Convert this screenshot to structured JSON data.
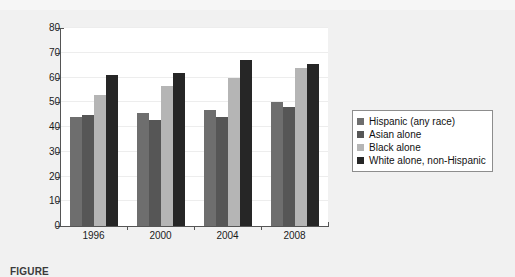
{
  "figure": {
    "background_color": "#f1f1f1",
    "plot_background_color": "#ffffff",
    "caption": "FIGURE"
  },
  "legend": {
    "position": "right",
    "border_color": "#8d8d8d",
    "entries": [
      {
        "label": "Hispanic (any race)",
        "color": "#6e6e6e"
      },
      {
        "label": "Asian alone",
        "color": "#565656"
      },
      {
        "label": "Black alone",
        "color": "#b5b5b5"
      },
      {
        "label": "White alone, non-Hispanic",
        "color": "#262626"
      }
    ]
  },
  "axes": {
    "y_ticks": [
      "0",
      "10",
      "20",
      "30",
      "40",
      "50",
      "60",
      "70",
      "80"
    ],
    "x_ticks": [
      "1996",
      "2000",
      "2004",
      "2008"
    ]
  },
  "chart_data": {
    "type": "bar",
    "title": "",
    "subtitle": "",
    "xlabel": "",
    "ylabel": "",
    "ylim": [
      0,
      80
    ],
    "ytick_step": 10,
    "grid": true,
    "legend_position": "right",
    "categories": [
      "1996",
      "2000",
      "2004",
      "2008"
    ],
    "series": [
      {
        "name": "Hispanic (any race)",
        "color": "#6e6e6e",
        "values": [
          44.0,
          45.5,
          47.0,
          50.0
        ]
      },
      {
        "name": "Asian alone",
        "color": "#565656",
        "values": [
          45.0,
          43.0,
          44.0,
          48.0
        ]
      },
      {
        "name": "Black alone",
        "color": "#b5b5b5",
        "values": [
          53.0,
          56.5,
          60.0,
          64.0
        ]
      },
      {
        "name": "White alone, non-Hispanic",
        "color": "#262626",
        "values": [
          61.0,
          62.0,
          67.0,
          65.5
        ]
      }
    ]
  }
}
